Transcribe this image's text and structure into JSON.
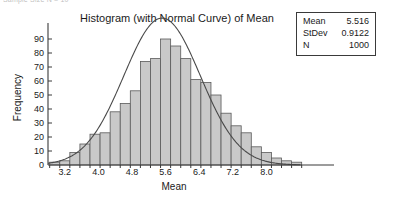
{
  "page": {
    "cutoff_text": "Sample Size N = 10"
  },
  "stats_box": {
    "rows": [
      {
        "label": "Mean",
        "value": "5.516"
      },
      {
        "label": "StDev",
        "value": "0.9122"
      },
      {
        "label": "N",
        "value": "1000"
      }
    ]
  },
  "style": {
    "bar_fill": "#c9c9c9",
    "bar_stroke": "#5a5a5a",
    "curve_color": "#4a4a4a",
    "axis_color": "#3a3a3a",
    "text_color": "#1a1a1a"
  },
  "chart_data": {
    "type": "bar",
    "title": "Histogram (with Normal Curve) of Mean",
    "xlabel": "Mean",
    "ylabel": "Frequency",
    "xlim": [
      2.8,
      8.8
    ],
    "ylim": [
      0,
      95
    ],
    "grid": false,
    "legend": null,
    "xticks": [
      "3.2",
      "4.0",
      "4.8",
      "5.6",
      "6.4",
      "7.2",
      "8.0"
    ],
    "xtick_values": [
      3.2,
      4.0,
      4.8,
      5.6,
      6.4,
      7.2,
      8.0
    ],
    "yticks": [
      "0",
      "10",
      "20",
      "30",
      "40",
      "50",
      "60",
      "70",
      "80",
      "90"
    ],
    "ytick_values": [
      0,
      10,
      20,
      30,
      40,
      50,
      60,
      70,
      80,
      90
    ],
    "bin_width": 0.24,
    "bin_centers": [
      2.96,
      3.2,
      3.44,
      3.68,
      3.92,
      4.16,
      4.4,
      4.64,
      4.88,
      5.12,
      5.36,
      5.6,
      5.84,
      6.08,
      6.32,
      6.56,
      6.8,
      7.04,
      7.28,
      7.52,
      7.76,
      8.0,
      8.24,
      8.48,
      8.72
    ],
    "values": [
      2,
      3,
      9,
      15,
      22,
      23,
      38,
      44,
      53,
      74,
      76,
      90,
      85,
      76,
      61,
      59,
      50,
      37,
      28,
      23,
      13,
      9,
      5,
      3,
      2
    ],
    "categories": [
      "2.96",
      "3.20",
      "3.44",
      "3.68",
      "3.92",
      "4.16",
      "4.40",
      "4.64",
      "4.88",
      "5.12",
      "5.36",
      "5.60",
      "5.84",
      "6.08",
      "6.32",
      "6.56",
      "6.80",
      "7.04",
      "7.28",
      "7.52",
      "7.76",
      "8.00",
      "8.24",
      "8.48",
      "8.72"
    ],
    "normal_curve": {
      "label": "Normal Curve",
      "mean": 5.516,
      "stdev": 0.9122,
      "n": 1000,
      "bin_width": 0.24,
      "peak_value": 87
    }
  }
}
